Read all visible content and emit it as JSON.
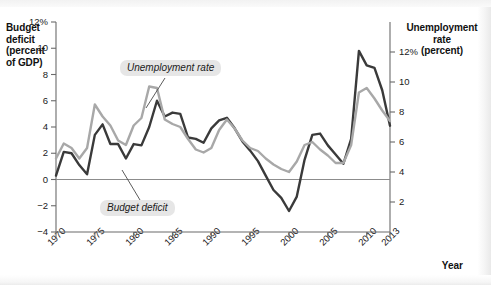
{
  "chart_data": {
    "type": "line",
    "title": "",
    "xlabel": "Year",
    "ylabel": "Budget deficit (percent of GDP)",
    "ylabel_right": "Unemployment rate (percent)",
    "xlim": [
      1970,
      2013
    ],
    "ylim": [
      -4,
      12
    ],
    "ylim_right": [
      0,
      14
    ],
    "grid": false,
    "legend_position": "inline-annotations",
    "x_tick_labels": [
      "1970",
      "1975",
      "1980",
      "1985",
      "1990",
      "1995",
      "2000",
      "2005",
      "2010",
      "2013"
    ],
    "x_tick_values": [
      1970,
      1975,
      1980,
      1985,
      1990,
      1995,
      2000,
      2005,
      2010,
      2013
    ],
    "y_tick_labels_left": [
      "12%",
      "10",
      "8",
      "6",
      "4",
      "2",
      "0",
      "-2",
      "-4"
    ],
    "y_tick_values_left": [
      12,
      10,
      8,
      6,
      4,
      2,
      0,
      -2,
      -4
    ],
    "y_tick_labels_right": [
      "12%",
      "10",
      "8",
      "6",
      "4",
      "2"
    ],
    "y_tick_values_right": [
      12,
      10,
      8,
      6,
      4,
      2
    ],
    "zero_line": 0,
    "x": [
      1970,
      1971,
      1972,
      1973,
      1974,
      1975,
      1976,
      1977,
      1978,
      1979,
      1980,
      1981,
      1982,
      1983,
      1984,
      1985,
      1986,
      1987,
      1988,
      1989,
      1990,
      1991,
      1992,
      1993,
      1994,
      1995,
      1996,
      1997,
      1998,
      1999,
      2000,
      2001,
      2002,
      2003,
      2004,
      2005,
      2006,
      2007,
      2008,
      2009,
      2010,
      2011,
      2012,
      2013
    ],
    "series": [
      {
        "name": "Budget deficit",
        "axis": "left",
        "color": "#3a3a3a",
        "values": [
          0.3,
          2.1,
          2.0,
          1.1,
          0.4,
          3.4,
          4.2,
          2.7,
          2.7,
          1.6,
          2.7,
          2.6,
          4.0,
          6.0,
          4.8,
          5.1,
          5.0,
          3.2,
          3.1,
          2.8,
          3.9,
          4.5,
          4.7,
          3.9,
          2.9,
          2.2,
          1.4,
          0.3,
          -0.8,
          -1.4,
          -2.4,
          -1.3,
          1.5,
          3.4,
          3.5,
          2.6,
          1.9,
          1.2,
          3.1,
          9.8,
          8.7,
          8.5,
          6.8,
          4.1
        ]
      },
      {
        "name": "Unemployment rate",
        "axis": "right",
        "color": "#a8a8a8",
        "values": [
          4.9,
          5.9,
          5.6,
          4.9,
          5.6,
          8.5,
          7.7,
          7.1,
          6.1,
          5.8,
          7.1,
          7.6,
          9.7,
          9.6,
          7.5,
          7.2,
          7.0,
          6.2,
          5.5,
          5.3,
          5.6,
          6.8,
          7.5,
          6.9,
          6.1,
          5.6,
          5.4,
          4.9,
          4.5,
          4.2,
          4.0,
          4.7,
          5.8,
          6.0,
          5.5,
          5.1,
          4.6,
          4.6,
          5.8,
          9.3,
          9.6,
          8.9,
          8.1,
          7.4
        ]
      }
    ],
    "annotations": [
      {
        "text": "Unemployment rate",
        "style": "italic-pill"
      },
      {
        "text": "Budget deficit",
        "style": "italic-pill"
      }
    ]
  },
  "labels": {
    "left_axis_title": "Budget deficit (percent of GDP)",
    "left_axis_title_lines": [
      "Budget",
      "deficit",
      "(percent",
      "of GDP)"
    ],
    "right_axis_title_lines": [
      "Unemployment",
      "rate",
      "(percent)"
    ],
    "x_axis_title": "Year",
    "series_unemployment": "Unemployment rate",
    "series_deficit": "Budget deficit"
  },
  "colors": {
    "deficit_line": "#3a3a3a",
    "unemployment_line": "#a8a8a8",
    "axis": "#6b6b6b",
    "zero_line": "#8c8c8c",
    "label_pill": "#e6e6e6",
    "text": "#1a1a1a"
  }
}
